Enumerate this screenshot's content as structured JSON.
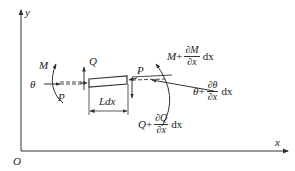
{
  "diagram": {
    "type": "beam element free-body diagram",
    "axes": {
      "origin_label": "O",
      "x_label": "x",
      "y_label": "y"
    },
    "element": {
      "length_label": "Ldx"
    },
    "left_end": {
      "moment_label": "M",
      "rotation_label": "θ",
      "axial_force_label": "P",
      "shear_force_label": "Q"
    },
    "right_end": {
      "axial_force_label": "P",
      "moment": {
        "base": "M",
        "plus": "+",
        "numerator": "∂M",
        "denominator": "∂x",
        "differential": "dx"
      },
      "rotation": {
        "base": "θ",
        "plus": "+",
        "numerator": "∂θ",
        "denominator": "∂x",
        "differential": "dx"
      },
      "shear": {
        "base": "Q",
        "plus": "+",
        "numerator": "∂Q",
        "denominator": "∂x",
        "differential": "dx"
      }
    },
    "colors": {
      "stroke": "#333333",
      "text": "#222222",
      "background": "#ffffff"
    }
  }
}
